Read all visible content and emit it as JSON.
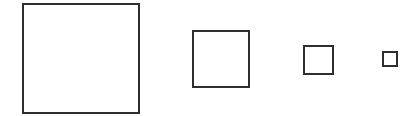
{
  "diagram": {
    "background": "#ffffff",
    "stroke_color": "#2e2e2e",
    "stroke_width": 2,
    "shapes": [
      {
        "id": "square-1",
        "type": "square",
        "x": 23,
        "y": 4,
        "width": 116,
        "height": 109
      },
      {
        "id": "square-2",
        "type": "square",
        "x": 193,
        "y": 31,
        "width": 56,
        "height": 56
      },
      {
        "id": "square-3",
        "type": "square",
        "x": 304,
        "y": 46,
        "width": 29,
        "height": 28
      },
      {
        "id": "square-4",
        "type": "square",
        "x": 383,
        "y": 52,
        "width": 14,
        "height": 14
      }
    ]
  }
}
